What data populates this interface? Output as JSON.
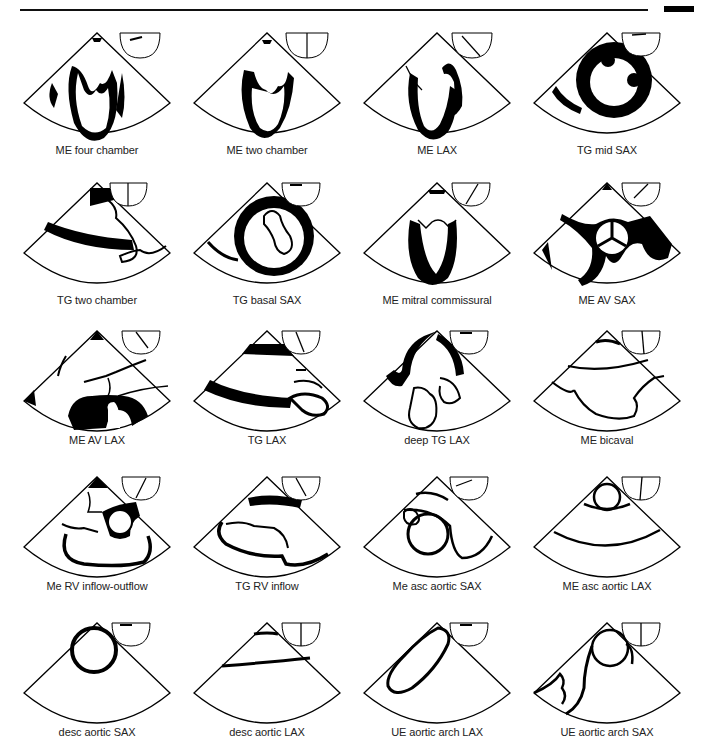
{
  "header": {
    "rule": "top-rule",
    "tab": "corner-tab"
  },
  "views": [
    {
      "label": "ME four chamber",
      "angle": 0,
      "row": 0,
      "col": 0
    },
    {
      "label": "ME two chamber",
      "angle": 90,
      "row": 0,
      "col": 1
    },
    {
      "label": "ME LAX",
      "angle": 135,
      "row": 0,
      "col": 2
    },
    {
      "label": "TG mid SAX",
      "angle": 0,
      "row": 0,
      "col": 3
    },
    {
      "label": "TG two chamber",
      "angle": 90,
      "row": 1,
      "col": 0
    },
    {
      "label": "TG basal SAX",
      "angle": 0,
      "row": 1,
      "col": 1
    },
    {
      "label": "ME mitral commissural",
      "angle": 60,
      "row": 1,
      "col": 2
    },
    {
      "label": "ME AV SAX",
      "angle": 40,
      "row": 1,
      "col": 3
    },
    {
      "label": "ME AV LAX",
      "angle": 130,
      "row": 2,
      "col": 0
    },
    {
      "label": "TG LAX",
      "angle": 110,
      "row": 2,
      "col": 1
    },
    {
      "label": "deep TG LAX",
      "angle": 0,
      "row": 2,
      "col": 2
    },
    {
      "label": "ME bicaval",
      "angle": 100,
      "row": 2,
      "col": 3
    },
    {
      "label": "Me RV inflow-outflow",
      "angle": 70,
      "row": 3,
      "col": 0
    },
    {
      "label": "TG RV inflow",
      "angle": 120,
      "row": 3,
      "col": 1
    },
    {
      "label": "Me asc aortic SAX",
      "angle": 30,
      "row": 3,
      "col": 2
    },
    {
      "label": "ME asc aortic LAX",
      "angle": 100,
      "row": 3,
      "col": 3
    },
    {
      "label": "desc aortic SAX",
      "angle": 0,
      "row": 4,
      "col": 0
    },
    {
      "label": "desc aortic LAX",
      "angle": 90,
      "row": 4,
      "col": 1
    },
    {
      "label": "UE aortic arch LAX",
      "angle": 0,
      "row": 4,
      "col": 2
    },
    {
      "label": "UE aortic arch SAX",
      "angle": 90,
      "row": 4,
      "col": 3
    }
  ]
}
